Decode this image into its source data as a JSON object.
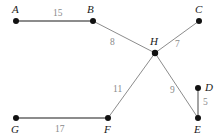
{
  "diagram": {
    "colors": {
      "node_fill": "#111111",
      "edge_stroke": "#8c8c8c",
      "edge_label": "#8a8a8a",
      "node_label": "#1a1a1a",
      "background": "#ffffff"
    },
    "nodes": [
      {
        "id": "A",
        "label": "A",
        "x": 16,
        "y": 21,
        "label_x": 12,
        "label_y": 4,
        "dot_r": 3.0
      },
      {
        "id": "B",
        "label": "B",
        "x": 93,
        "y": 21,
        "label_x": 87,
        "label_y": 4,
        "dot_r": 3.0
      },
      {
        "id": "C",
        "label": "C",
        "x": 199,
        "y": 21,
        "label_x": 195,
        "label_y": 4,
        "dot_r": 3.0
      },
      {
        "id": "D",
        "label": "D",
        "x": 198,
        "y": 88,
        "label_x": 205,
        "label_y": 82,
        "dot_r": 3.0
      },
      {
        "id": "E",
        "label": "E",
        "x": 198,
        "y": 118,
        "label_x": 194,
        "label_y": 124,
        "dot_r": 3.0
      },
      {
        "id": "F",
        "label": "F",
        "x": 108,
        "y": 118,
        "label_x": 104,
        "label_y": 124,
        "dot_r": 3.0
      },
      {
        "id": "G",
        "label": "G",
        "x": 16,
        "y": 118,
        "label_x": 11,
        "label_y": 124,
        "dot_r": 3.0
      },
      {
        "id": "H",
        "label": "H",
        "x": 155,
        "y": 53,
        "label_x": 150,
        "label_y": 36,
        "dot_r": 3.2
      }
    ],
    "edges": [
      {
        "id": "A-B",
        "from": "A",
        "to": "B",
        "weight": "15",
        "label_x": 53,
        "label_y": 9,
        "width": 2.2
      },
      {
        "id": "B-H",
        "from": "B",
        "to": "H",
        "weight": "8",
        "label_x": 110,
        "label_y": 38,
        "width": 1.0
      },
      {
        "id": "H-C",
        "from": "H",
        "to": "C",
        "weight": "7",
        "label_x": 175,
        "label_y": 40,
        "width": 1.0
      },
      {
        "id": "H-F",
        "from": "H",
        "to": "F",
        "weight": "11",
        "label_x": 113,
        "label_y": 85,
        "width": 1.0
      },
      {
        "id": "H-E",
        "from": "H",
        "to": "E",
        "weight": "9",
        "label_x": 170,
        "label_y": 86,
        "width": 1.0
      },
      {
        "id": "D-E",
        "from": "D",
        "to": "E",
        "weight": "5",
        "label_x": 203,
        "label_y": 98,
        "width": 1.6
      },
      {
        "id": "G-F",
        "from": "G",
        "to": "F",
        "weight": "17",
        "label_x": 55,
        "label_y": 125,
        "width": 2.2
      }
    ]
  }
}
